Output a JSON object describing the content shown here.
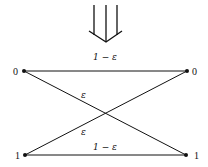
{
  "diagram": {
    "arrow": {
      "type": "triple-down-arrow"
    },
    "inputs": [
      {
        "label": "0",
        "x": 24,
        "y": 71
      },
      {
        "label": "1",
        "x": 25,
        "y": 155
      }
    ],
    "outputs": [
      {
        "label": "0",
        "x": 187,
        "y": 71
      },
      {
        "label": "1",
        "x": 186,
        "y": 155
      }
    ],
    "edges": [
      {
        "from": "0",
        "to": "0",
        "label": "1 − ε"
      },
      {
        "from": "1",
        "to": "1",
        "label": "1 − ε"
      },
      {
        "from": "0",
        "to": "1",
        "label": "ε"
      },
      {
        "from": "1",
        "to": "0",
        "label": "ε"
      }
    ]
  }
}
